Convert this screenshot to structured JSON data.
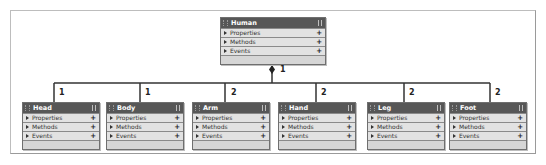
{
  "diagram": {
    "type": "class-aggregation",
    "line_color": "#333333",
    "header_color": "#575757",
    "row_color": "#e2e2e2",
    "root": {
      "name": "Human",
      "rows": [
        {
          "label": "Properties",
          "action": "+"
        },
        {
          "label": "Methods",
          "action": "+"
        },
        {
          "label": "Events",
          "action": "+"
        }
      ],
      "multiplicity": "1"
    },
    "children": [
      {
        "name": "Head",
        "multiplicity": "1",
        "rows": [
          {
            "label": "Properties",
            "action": "+"
          },
          {
            "label": "Methods",
            "action": "+"
          },
          {
            "label": "Events",
            "action": "+"
          }
        ]
      },
      {
        "name": "Body",
        "multiplicity": "1",
        "rows": [
          {
            "label": "Properties",
            "action": "+"
          },
          {
            "label": "Methods",
            "action": "+"
          },
          {
            "label": "Events",
            "action": "+"
          }
        ]
      },
      {
        "name": "Arm",
        "multiplicity": "2",
        "rows": [
          {
            "label": "Properties",
            "action": "+"
          },
          {
            "label": "Methods",
            "action": "+"
          },
          {
            "label": "Events",
            "action": "+"
          }
        ]
      },
      {
        "name": "Hand",
        "multiplicity": "2",
        "rows": [
          {
            "label": "Properties",
            "action": "+"
          },
          {
            "label": "Methods",
            "action": "+"
          },
          {
            "label": "Events",
            "action": "+"
          }
        ]
      },
      {
        "name": "Leg",
        "multiplicity": "2",
        "rows": [
          {
            "label": "Properties",
            "action": "+"
          },
          {
            "label": "Methods",
            "action": "+"
          },
          {
            "label": "Events",
            "action": "+"
          }
        ]
      },
      {
        "name": "Foot",
        "multiplicity": "2",
        "rows": [
          {
            "label": "Properties",
            "action": "+"
          },
          {
            "label": "Methods",
            "action": "+"
          },
          {
            "label": "Events",
            "action": "+"
          }
        ]
      }
    ]
  }
}
